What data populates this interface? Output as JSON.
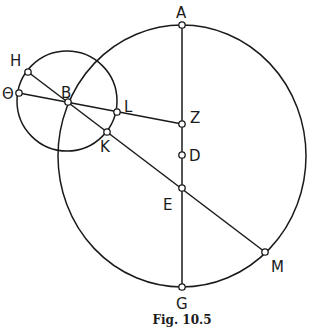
{
  "figure": {
    "caption": "Fig. 10.5",
    "stroke_color": "#1a1a1a",
    "background": "#ffffff"
  },
  "circles": [
    {
      "name": "large-circle",
      "cx": 182,
      "cy": 156,
      "rx": 124,
      "ry": 131
    },
    {
      "name": "small-circle",
      "cx": 67,
      "cy": 101,
      "rx": 50,
      "ry": 50
    }
  ],
  "points": {
    "A": {
      "label": "A",
      "x": 182,
      "y": 25,
      "lx": 176,
      "ly": 18
    },
    "G": {
      "label": "G",
      "x": 182,
      "y": 287,
      "lx": 176,
      "ly": 309
    },
    "Z": {
      "label": "Z",
      "x": 182,
      "y": 124,
      "lx": 190,
      "ly": 123
    },
    "D": {
      "label": "D",
      "x": 182,
      "y": 155,
      "lx": 189,
      "ly": 161
    },
    "E": {
      "label": "E",
      "x": 182,
      "y": 188,
      "lx": 163,
      "ly": 210
    },
    "B": {
      "label": "B",
      "x": 68,
      "y": 102,
      "lx": 61,
      "ly": 98
    },
    "H": {
      "label": "H",
      "x": 28,
      "y": 72,
      "lx": 10,
      "ly": 66
    },
    "Theta": {
      "label": "Θ",
      "x": 19,
      "y": 93,
      "lx": 2,
      "ly": 99
    },
    "L": {
      "label": "L",
      "x": 117,
      "y": 112,
      "lx": 124,
      "ly": 112
    },
    "K": {
      "label": "K",
      "x": 107,
      "y": 132,
      "lx": 100,
      "ly": 152
    },
    "M": {
      "label": "M",
      "x": 265,
      "y": 252,
      "lx": 271,
      "ly": 272
    }
  },
  "segments": [
    {
      "from": "A",
      "to": "G"
    },
    {
      "from": "H",
      "to": "M"
    },
    {
      "from": "Theta",
      "to": "Z"
    }
  ]
}
